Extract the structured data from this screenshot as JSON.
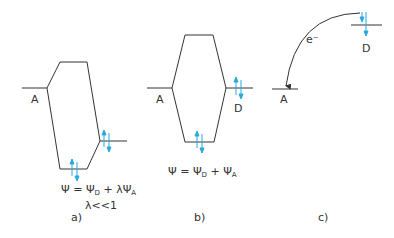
{
  "colors": {
    "line": "#333333",
    "electron": "#29a9e0"
  },
  "panels": [
    {
      "id": "a",
      "label": "a)",
      "level_A": "A",
      "formula": {
        "psi": "Ψ",
        "eq": " = ",
        "psiD": "Ψ",
        "subD": "D",
        "plus": " + λ",
        "psiA": "Ψ",
        "subA": "A"
      },
      "condition": "λ<<1"
    },
    {
      "id": "b",
      "label": "b)",
      "level_A": "A",
      "level_D": "D",
      "formula": {
        "psi": "Ψ",
        "eq": " = ",
        "psiD": "Ψ",
        "subD": "D",
        "plus": " + ",
        "psiA": "Ψ",
        "subA": "A"
      }
    },
    {
      "id": "c",
      "label": "c)",
      "level_A": "A",
      "level_D": "D",
      "electron": "e⁻"
    }
  ]
}
